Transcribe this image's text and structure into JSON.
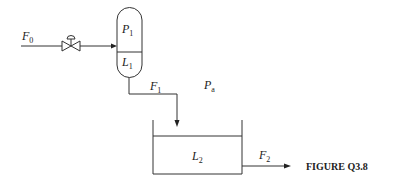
{
  "figure": {
    "caption": "FIGURE Q3.8",
    "labels": {
      "F0": {
        "main": "F",
        "sub": "0"
      },
      "P1": {
        "main": "P",
        "sub": "1"
      },
      "L1": {
        "main": "L",
        "sub": "1"
      },
      "F1": {
        "main": "F",
        "sub": "1"
      },
      "Pa": {
        "main": "P",
        "sub": "a"
      },
      "L2": {
        "main": "L",
        "sub": "2"
      },
      "F2": {
        "main": "F",
        "sub": "2"
      }
    },
    "components": [
      "inlet-stream",
      "control-valve",
      "pressurized-vessel",
      "transfer-pipe",
      "open-tank",
      "outlet-stream"
    ],
    "colors": {
      "line": "#333333",
      "background": "#ffffff"
    }
  }
}
